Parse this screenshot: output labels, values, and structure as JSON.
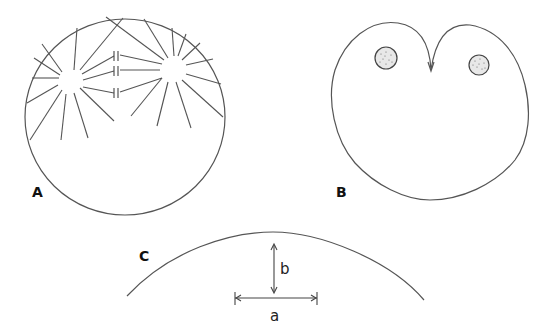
{
  "figure": {
    "panels": [
      {
        "id": "A",
        "label": "A",
        "description": "Spherical cell with two asters; astral rays reaching the cortex and spindle microtubules meeting at the equator"
      },
      {
        "id": "B",
        "label": "B",
        "description": "Cell with cleavage furrow ingressing from the top, two stippled nuclei"
      },
      {
        "id": "C",
        "label": "C",
        "description": "Arc of cell surface with chord length a and arc height b",
        "dimensions": {
          "chord_label": "a",
          "height_label": "b"
        }
      }
    ]
  }
}
